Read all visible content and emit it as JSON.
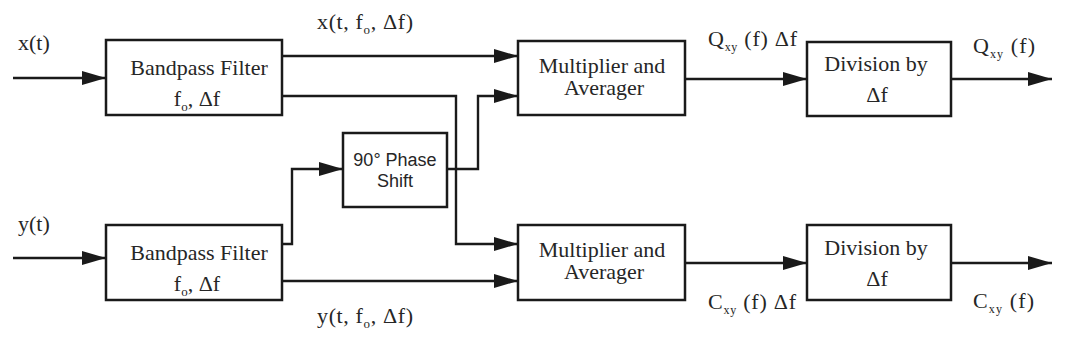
{
  "diagram": {
    "inputs": {
      "x": {
        "label": "x(t)"
      },
      "y": {
        "label": "y(t)"
      }
    },
    "blocks": {
      "bandpass_x": {
        "title": "Bandpass Filter",
        "param_main": "f",
        "param_sub": "o",
        "param_rest": ", Δf"
      },
      "bandpass_y": {
        "title": "Bandpass Filter",
        "param_main": "f",
        "param_sub": "o",
        "param_rest": ", Δf"
      },
      "phase_shift": {
        "line1": "90° Phase",
        "line2": "Shift"
      },
      "multiplier_q": {
        "line1": "Multiplier and",
        "line2": "Averager"
      },
      "multiplier_c": {
        "line1": "Multiplier and",
        "line2": "Averager"
      },
      "division_q": {
        "line1": "Division by",
        "line2": "Δf"
      },
      "division_c": {
        "line1": "Division by",
        "line2": "Δf"
      }
    },
    "signals": {
      "x_filtered": {
        "main": "x(t, f",
        "sub": "o",
        "rest": ", Δf)"
      },
      "y_filtered": {
        "main": "y(t, f",
        "sub": "o",
        "rest": ", Δf)"
      },
      "q_times_df": {
        "main": "Q",
        "sub": "xy",
        "rest": " (f) Δf"
      },
      "c_times_df": {
        "main": "C",
        "sub": "xy",
        "rest": " (f) Δf"
      },
      "q_out": {
        "main": "Q",
        "sub": "xy",
        "rest": " (f)"
      },
      "c_out": {
        "main": "C",
        "sub": "xy",
        "rest": " (f)"
      }
    }
  },
  "colors": {
    "line": "#1a1a1a",
    "text": "#262626",
    "background": "#ffffff"
  }
}
